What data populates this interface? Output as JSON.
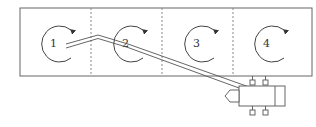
{
  "diagram": {
    "type": "chambered tank with pipe and pump",
    "chambers": [
      {
        "label": "1"
      },
      {
        "label": "2"
      },
      {
        "label": "3"
      },
      {
        "label": "4"
      }
    ],
    "stroke_color": "#555555",
    "divider_style": "dashed",
    "flow_arrow": "clockwise"
  }
}
